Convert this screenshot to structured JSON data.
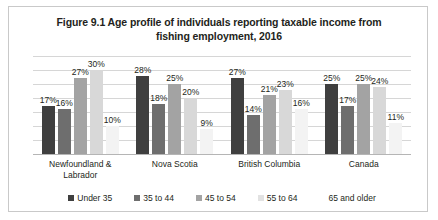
{
  "chart_data": {
    "type": "bar",
    "title": "Figure 9.1 Age profile of individuals reporting taxable income from fishing employment, 2016",
    "title_line1": "Figure 9.1 Age profile of individuals reporting taxable income from",
    "title_line2": "fishing employment, 2016",
    "xlabel": "",
    "ylabel": "",
    "ylim": [
      0,
      35
    ],
    "grid": true,
    "gridlines": [
      0,
      5,
      10,
      15,
      20,
      25,
      30,
      35
    ],
    "legend_position": "bottom",
    "categories": [
      "Newfoundland & Labrador",
      "Nova Scotia",
      "British Columbia",
      "Canada"
    ],
    "series": [
      {
        "name": "Under 35",
        "color": "#3f3f3f",
        "values": [
          17,
          28,
          27,
          25
        ],
        "labels": [
          "17%",
          "28%",
          "27%",
          "25%"
        ]
      },
      {
        "name": "35 to 44",
        "color": "#6e6e6e",
        "values": [
          16,
          18,
          14,
          17
        ],
        "labels": [
          "16%",
          "18%",
          "14%",
          "17%"
        ]
      },
      {
        "name": "45 to 54",
        "color": "#a3a3a3",
        "values": [
          27,
          25,
          21,
          25
        ],
        "labels": [
          "27%",
          "25%",
          "21%",
          "25%"
        ]
      },
      {
        "name": "55 to 64",
        "color": "#d8d8d8",
        "values": [
          30,
          20,
          23,
          24
        ],
        "labels": [
          "30%",
          "20%",
          "23%",
          "24%"
        ]
      },
      {
        "name": "65 and older",
        "color": "#f3f3f3",
        "values": [
          10,
          9,
          16,
          11
        ],
        "labels": [
          "10%",
          "9%",
          "16%",
          "11%"
        ]
      }
    ]
  }
}
